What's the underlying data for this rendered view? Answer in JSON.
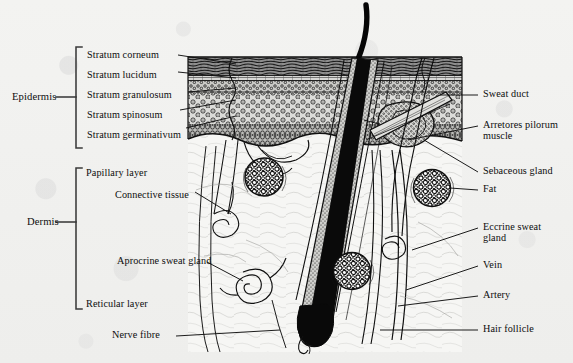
{
  "figure": {
    "type": "anatomical-line-diagram",
    "background_color": "#f2f2f0",
    "ink_color": "#101010"
  },
  "brackets": [
    {
      "name": "epidermis",
      "label": "Epidermis"
    },
    {
      "name": "dermis",
      "label": "Dermis"
    }
  ],
  "left_labels": {
    "epidermis_layers": [
      {
        "label": "Stratum corneum"
      },
      {
        "label": "Stratum lucidum"
      },
      {
        "label": "Stratum granulosum"
      },
      {
        "label": "Stratum spinosum"
      },
      {
        "label": "Stratum germinativum"
      }
    ],
    "dermis_layers": [
      {
        "label": "Papillary layer"
      },
      {
        "label": "Connective tissue"
      },
      {
        "label": "Aprocrine sweat gland"
      },
      {
        "label": "Reticular layer"
      }
    ],
    "bottom": [
      {
        "label": "Nerve fibre"
      }
    ]
  },
  "right_labels": [
    {
      "label": "Sweat duct"
    },
    {
      "label": "Arretores pilorum",
      "label2": "muscle"
    },
    {
      "label": "Sebaceous gland"
    },
    {
      "label": "Fat"
    },
    {
      "label": "Eccrine sweat",
      "label2": "gland"
    },
    {
      "label": "Vein"
    },
    {
      "label": "Artery"
    },
    {
      "label": "Hair follicle"
    }
  ]
}
